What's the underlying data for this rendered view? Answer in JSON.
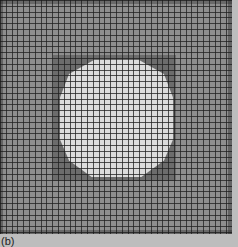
{
  "figure": {
    "label": "(b)",
    "colors": {
      "background": "#8e8e8e",
      "inner_square": "#6c6c6c",
      "disk": "#dcdcdc",
      "grid_lines": "#1e1e1e",
      "margin": "#bdbdbd"
    }
  }
}
